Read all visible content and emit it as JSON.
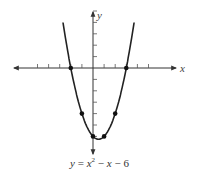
{
  "chart_data": {
    "type": "line",
    "title": "",
    "equation": "y = x^2 - x - 6",
    "caption": "y = x² − x − 6",
    "xlabel": "x",
    "ylabel": "y",
    "xlim": [
      -5,
      5.5
    ],
    "ylim": [
      -7,
      5
    ],
    "x_ticks": [
      -5,
      -4,
      -3,
      -2,
      -1,
      1,
      2,
      3,
      4,
      5
    ],
    "y_ticks": [
      -6,
      -5,
      -4,
      -3,
      -2,
      -1,
      1,
      2,
      3,
      4,
      5
    ],
    "grid": false,
    "curve": {
      "name": "parabola",
      "function": "x^2 - x - 6",
      "x_range": [
        -2.7,
        3.7
      ]
    },
    "points": [
      {
        "x": -2,
        "y": 0
      },
      {
        "x": -1,
        "y": -4
      },
      {
        "x": 0,
        "y": -6
      },
      {
        "x": 1,
        "y": -6
      },
      {
        "x": 2,
        "y": -4
      },
      {
        "x": 3,
        "y": 0
      }
    ],
    "colors": {
      "curve": "#222222",
      "axes": "#333333"
    }
  }
}
